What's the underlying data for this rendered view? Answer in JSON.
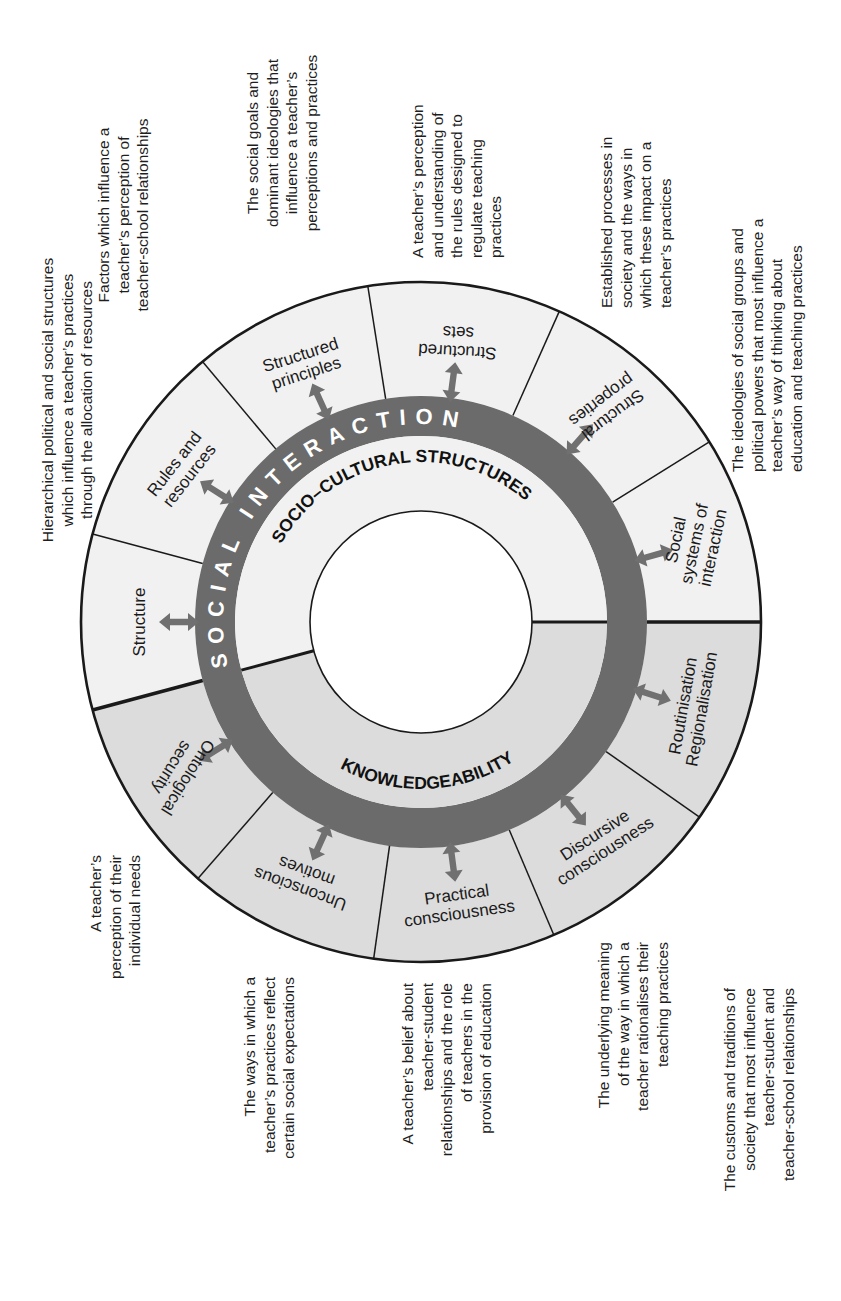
{
  "colors": {
    "knowledge_fill": "#dcdcdc",
    "structure_fill": "#f1f1f1",
    "ring": "#6b6b6b",
    "arrow": "#707070",
    "line": "#1a1a1a",
    "center": "#ffffff"
  },
  "ring": {
    "outer_label": "SOCIAL INTERACTION",
    "upper_label": "SOCIO–CULTURAL STRUCTURES",
    "lower_label": "KNOWLEDGEABILITY"
  },
  "segments": [
    {
      "id": "structure",
      "group": "structures",
      "lines": [
        "Structure"
      ]
    },
    {
      "id": "rules-and-resources",
      "group": "structures",
      "lines": [
        "Rules and",
        "resources"
      ]
    },
    {
      "id": "structured-principles",
      "group": "structures",
      "lines": [
        "Structured",
        "principles"
      ]
    },
    {
      "id": "structured-sets",
      "group": "structures",
      "lines": [
        "Structured",
        "sets"
      ]
    },
    {
      "id": "structural-properties",
      "group": "structures",
      "lines": [
        "Structural",
        "properties"
      ]
    },
    {
      "id": "social-systems-of-interaction",
      "group": "structures",
      "lines": [
        "Social",
        "systems of",
        "interaction"
      ]
    },
    {
      "id": "routinisation-regionalisation",
      "group": "knowledgeability",
      "lines": [
        "Routinisation",
        "Regionalisation"
      ]
    },
    {
      "id": "discursive-consciousness",
      "group": "knowledgeability",
      "lines": [
        "Discursive",
        "consciousness"
      ]
    },
    {
      "id": "practical-consciousness",
      "group": "knowledgeability",
      "lines": [
        "Practical",
        "consciousness"
      ]
    },
    {
      "id": "unconscious-motives",
      "group": "knowledgeability",
      "lines": [
        "Unconscious",
        "motives"
      ]
    },
    {
      "id": "ontological-security",
      "group": "knowledgeability",
      "lines": [
        "Ontological",
        "security"
      ]
    }
  ],
  "descriptions": [
    {
      "for": "structure",
      "lines": [
        "Hierarchical political and social structures",
        "which influence a teacher’s practices",
        "through the allocation of resources"
      ]
    },
    {
      "for": "rules-and-resources",
      "lines": [
        "Factors which influence a",
        "teacher’s perception of",
        "teacher-school relationships"
      ]
    },
    {
      "for": "structured-principles",
      "lines": [
        "The social goals and",
        "dominant ideologies that",
        "influence a teacher’s",
        "perceptions and practices"
      ]
    },
    {
      "for": "structured-sets",
      "lines": [
        "A teacher’s perception",
        "and understanding of",
        "the rules designed to",
        "regulate teaching",
        "practices"
      ]
    },
    {
      "for": "structural-properties",
      "lines": [
        "Established processes in",
        "society and the ways in",
        "which these impact on a",
        "teacher’s practices"
      ]
    },
    {
      "for": "social-systems-of-interaction",
      "lines": [
        "The ideologies of social groups and",
        "political powers that most influence a",
        "teacher’s way of thinking about",
        "education and teaching practices"
      ]
    },
    {
      "for": "ontological-security",
      "lines": [
        "A teacher’s",
        "perception of their",
        "individual needs"
      ]
    },
    {
      "for": "unconscious-motives",
      "lines": [
        "The ways in which a",
        "teacher’s practices reflect",
        "certain social expectations"
      ]
    },
    {
      "for": "practical-consciousness",
      "lines": [
        "A teacher’s belief about",
        "teacher-student",
        "relationships and the role",
        "of teachers in the",
        "provision of education"
      ]
    },
    {
      "for": "discursive-consciousness",
      "lines": [
        "The underlying meaning",
        "of the way in which a",
        "teacher rationalises their",
        "teaching practices"
      ]
    },
    {
      "for": "routinisation-regionalisation",
      "lines": [
        "The customs and traditions of",
        "society that most influence",
        "teacher-student and",
        "teacher-school relationships"
      ]
    }
  ]
}
